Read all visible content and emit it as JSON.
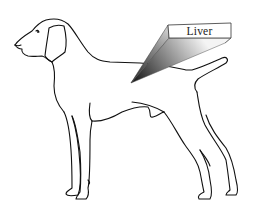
{
  "diagram": {
    "callout": {
      "label": "Liver",
      "pointer_style": "gradient-wedge",
      "colors": {
        "wedge_dark": "#1a1a1a",
        "wedge_light": "#f2f2f2",
        "box_border": "#333333",
        "box_fill": "#ffffff"
      }
    },
    "colors": {
      "background": "#ffffff",
      "outline": "#111111"
    }
  }
}
